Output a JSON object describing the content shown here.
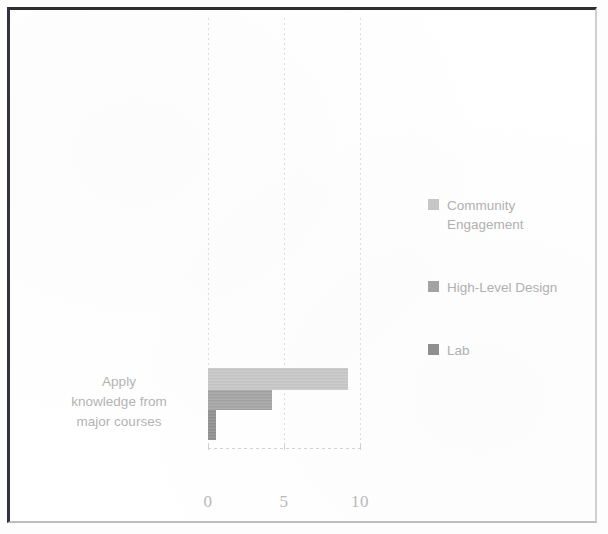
{
  "chart_data": {
    "type": "bar",
    "orientation": "horizontal",
    "title": "",
    "subtitle": "",
    "xlabel": "",
    "ylabel": "",
    "categories": [
      "Apply knowledge from major courses"
    ],
    "category_lines": [
      "Apply",
      "knowledge from",
      "major courses"
    ],
    "series": [
      {
        "name": "Community Engagement",
        "values": [
          9.2
        ],
        "color": "#c6c6c6"
      },
      {
        "name": "High-Level Design",
        "values": [
          4.2
        ],
        "color": "#a3a3a3"
      },
      {
        "name": "Lab",
        "values": [
          0.5
        ],
        "color": "#8f8f8f"
      }
    ],
    "xlim": [
      0,
      10
    ],
    "xticks": [
      0,
      5,
      10
    ],
    "xtick_labels": [
      "0",
      "5",
      "10"
    ],
    "grid": true,
    "grid_style": "dotted-vertical",
    "legend_position": "right"
  },
  "legend": {
    "items": [
      {
        "label": "Community Engagement",
        "swatch_color": "#c6c6c6"
      },
      {
        "label": "High-Level Design",
        "swatch_color": "#a3a3a3"
      },
      {
        "label": "Lab",
        "swatch_color": "#8f8f8f"
      }
    ]
  },
  "axis": {
    "ticks": [
      {
        "label": "0",
        "value": 0
      },
      {
        "label": "5",
        "value": 5
      },
      {
        "label": "10",
        "value": 10
      }
    ]
  },
  "category": {
    "line1": "Apply",
    "line2": "knowledge from",
    "line3": "major courses"
  },
  "colors": {
    "frame": "#2e2e2e",
    "background": "#ffffff",
    "text": "#b3b3b3",
    "gridline": "#dcdcdc"
  }
}
